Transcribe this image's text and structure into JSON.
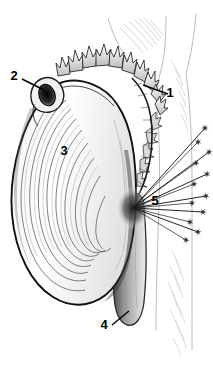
{
  "figure": {
    "name": "mussel-anatomy-diagram",
    "type": "line-drawing",
    "background_color": "#ffffff",
    "ink_color": "#000000",
    "width": 213,
    "height": 386
  },
  "callouts": [
    {
      "id": "1",
      "label": "1",
      "target": "mantle-edge-papillae",
      "label_x": 170,
      "label_y": 97,
      "leader": "M168,94 L143,85"
    },
    {
      "id": "2",
      "label": "2",
      "target": "umbo-dark-aperture",
      "label_x": 14,
      "label_y": 80,
      "leader": "M22,79 L44,90"
    },
    {
      "id": "3",
      "label": "3",
      "target": "shell-valve-growth-lines",
      "label_x": 64,
      "label_y": 155,
      "leader": ""
    },
    {
      "id": "4",
      "label": "4",
      "target": "foot",
      "label_x": 104,
      "label_y": 329,
      "leader": "M112,325 L129,311"
    },
    {
      "id": "5",
      "label": "5",
      "target": "byssal-threads",
      "label_x": 155,
      "label_y": 205,
      "leader": ""
    }
  ],
  "parts": {
    "shell": "shell-valve",
    "growth_lines": "concentric-growth-lines",
    "papillae": "mantle-edge-papillae",
    "umbo": "umbo",
    "foot": "foot",
    "byssus": "byssal-threads",
    "substrate": "rock-substrate"
  },
  "byssal_threads": {
    "origin_x": 133,
    "origin_y": 208,
    "count": 12,
    "endpoints": [
      [
        205,
        128
      ],
      [
        198,
        142
      ],
      [
        209,
        152
      ],
      [
        196,
        163
      ],
      [
        207,
        174
      ],
      [
        194,
        184
      ],
      [
        206,
        196
      ],
      [
        192,
        203
      ],
      [
        203,
        212
      ],
      [
        190,
        222
      ],
      [
        198,
        232
      ],
      [
        186,
        240
      ]
    ]
  }
}
